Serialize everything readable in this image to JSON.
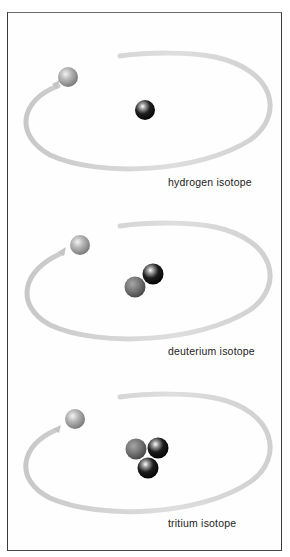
{
  "figure": {
    "title": "",
    "colors": {
      "frame": "#3a3a3a",
      "orbit": "#d4d4d4",
      "electron": "#a8a8a8",
      "proton": "#7a7a7a",
      "neutron": "#111111"
    },
    "panels": [
      {
        "label": "hydrogen isotope",
        "electrons": 1,
        "nucleus": [
          {
            "type": "neutron-dark"
          }
        ]
      },
      {
        "label": "deuterium isotope",
        "electrons": 1,
        "nucleus": [
          {
            "type": "proton-gray"
          },
          {
            "type": "neutron-dark"
          }
        ]
      },
      {
        "label": "tritium isotope",
        "electrons": 1,
        "nucleus": [
          {
            "type": "proton-gray"
          },
          {
            "type": "neutron-dark"
          },
          {
            "type": "neutron-dark"
          }
        ]
      }
    ]
  }
}
